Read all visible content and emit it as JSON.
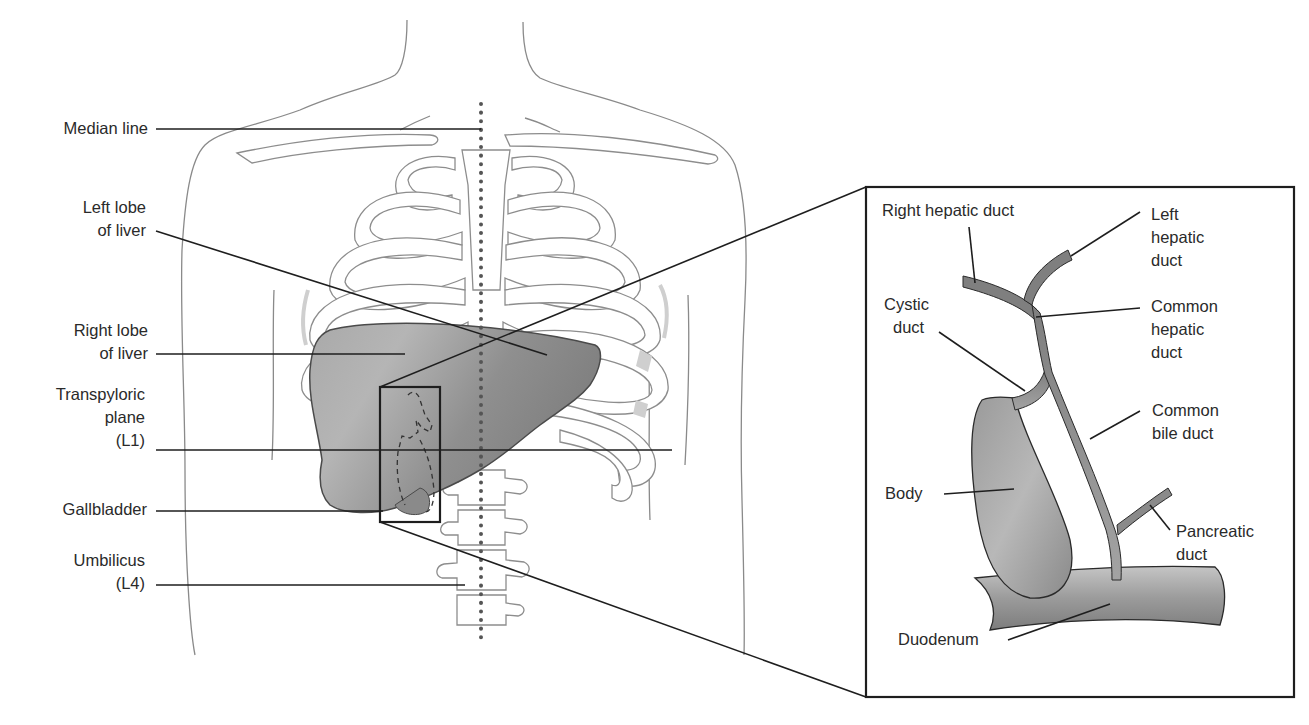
{
  "figure": {
    "main_view": "Anterior torso with liver and gallbladder surface anatomy",
    "inset_view": "Biliary tree detail",
    "colors": {
      "liver_fill": "#8f8f8f",
      "duct_fill": "#8a8a8a",
      "outline": "#8a8a8a",
      "leader_lines": "#1e1e1e",
      "background": "#ffffff"
    }
  },
  "left_labels": [
    {
      "id": "median_line",
      "lines": [
        "Median line"
      ]
    },
    {
      "id": "left_lobe",
      "lines": [
        "Left lobe",
        "of liver"
      ]
    },
    {
      "id": "right_lobe",
      "lines": [
        "Right lobe",
        "of liver"
      ]
    },
    {
      "id": "transpyloric",
      "lines": [
        "Transpyloric",
        "plane",
        "(L1)"
      ]
    },
    {
      "id": "gallbladder",
      "lines": [
        "Gallbladder"
      ]
    },
    {
      "id": "umbilicus",
      "lines": [
        "Umbilicus",
        "(L4)"
      ]
    }
  ],
  "inset_labels": [
    {
      "id": "right_hepatic_duct",
      "lines": [
        "Right hepatic duct"
      ]
    },
    {
      "id": "left_hepatic_duct",
      "lines": [
        "Left",
        "hepatic",
        "duct"
      ]
    },
    {
      "id": "cystic_duct",
      "lines": [
        "Cystic",
        "duct"
      ]
    },
    {
      "id": "common_hepatic_duct",
      "lines": [
        "Common",
        "hepatic",
        "duct"
      ]
    },
    {
      "id": "common_bile_duct",
      "lines": [
        "Common",
        "bile duct"
      ]
    },
    {
      "id": "body",
      "lines": [
        "Body"
      ]
    },
    {
      "id": "pancreatic_duct",
      "lines": [
        "Pancreatic",
        "duct"
      ]
    },
    {
      "id": "duodenum",
      "lines": [
        "Duodenum"
      ]
    }
  ]
}
